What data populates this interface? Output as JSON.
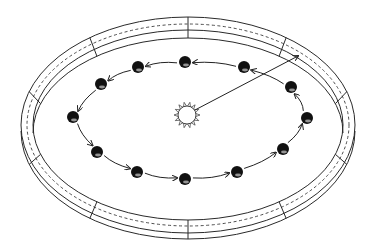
{
  "diagram": {
    "colors": {
      "ink": "#222222",
      "background": "#ffffff",
      "planet": "#111111"
    },
    "sun": {
      "cx": 187,
      "cy": 115,
      "r": 9,
      "rays": 14,
      "icon": "sun-icon"
    },
    "pointer": {
      "x1": 195,
      "y1": 110,
      "x2": 298,
      "y2": 56
    },
    "ring": {
      "outer_top": {
        "cx": 188,
        "cy": 125,
        "rx": 167,
        "ry": 108
      },
      "inner_top": {
        "cx": 188,
        "cy": 125,
        "rx": 155,
        "ry": 95
      },
      "dashed": {
        "cx": 188,
        "cy": 125,
        "rx": 161,
        "ry": 101
      },
      "wall_depth": 14,
      "segments": 10
    },
    "planets": [
      {
        "x": 185,
        "y": 62
      },
      {
        "x": 138,
        "y": 67
      },
      {
        "x": 101,
        "y": 84
      },
      {
        "x": 73,
        "y": 117
      },
      {
        "x": 97,
        "y": 152
      },
      {
        "x": 137,
        "y": 172
      },
      {
        "x": 185,
        "y": 179
      },
      {
        "x": 237,
        "y": 172
      },
      {
        "x": 283,
        "y": 149
      },
      {
        "x": 307,
        "y": 118
      },
      {
        "x": 291,
        "y": 87
      },
      {
        "x": 244,
        "y": 67
      }
    ],
    "orbit_direction": "counter-clockwise (as viewed)"
  }
}
